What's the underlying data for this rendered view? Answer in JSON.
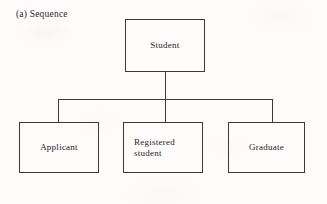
{
  "figure": {
    "caption": "(a) Sequence",
    "type": "tree-diagram",
    "orientation": "top-down",
    "stroke_color": "#3b3b3b",
    "text_color": "#1f1f1f",
    "background_color": "#fdfcfb"
  },
  "nodes": {
    "root": {
      "id": "student",
      "label": "Student"
    },
    "children": [
      {
        "id": "applicant",
        "label": "Applicant"
      },
      {
        "id": "registered-student",
        "label": "Registered\nstudent"
      },
      {
        "id": "graduate",
        "label": "Graduate"
      }
    ]
  },
  "edges": [
    {
      "from": "student",
      "to": "applicant"
    },
    {
      "from": "student",
      "to": "registered-student"
    },
    {
      "from": "student",
      "to": "graduate"
    }
  ]
}
